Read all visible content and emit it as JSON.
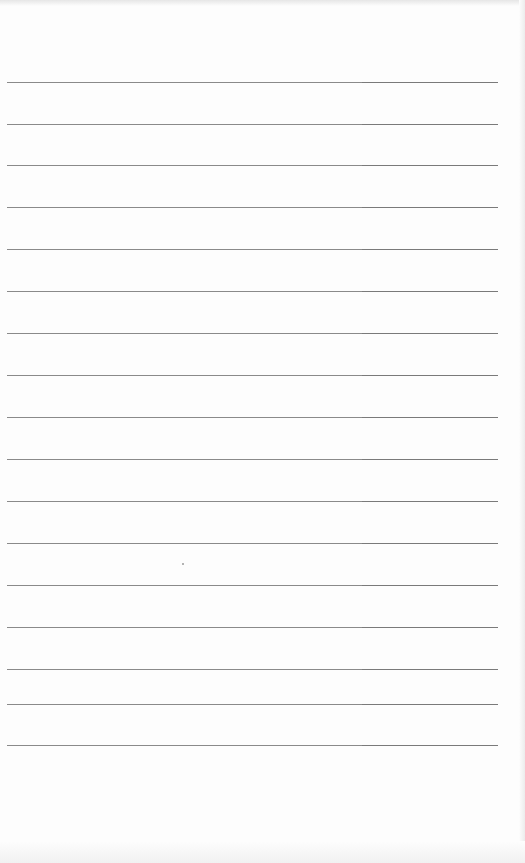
{
  "document": {
    "type": "lined-paper",
    "line_count": 17,
    "line_positions_y": [
      82,
      124,
      165,
      207,
      249,
      291,
      333,
      375,
      417,
      459,
      501,
      543,
      585,
      627,
      669,
      704,
      745
    ],
    "line_color": "#8a8a8a",
    "background_color": "#fdfdfd"
  }
}
